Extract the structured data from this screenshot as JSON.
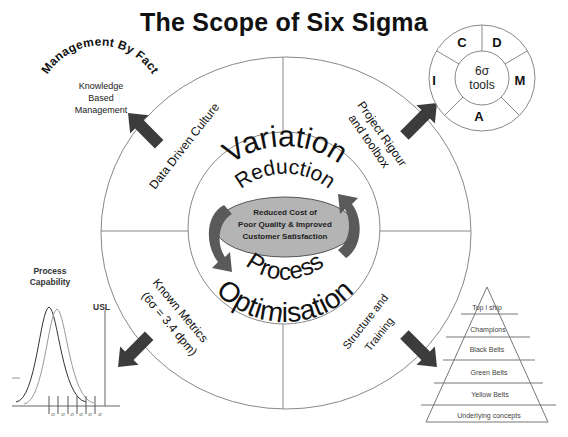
{
  "title": "The Scope of Six Sigma",
  "center": {
    "top_word_1": "Variation",
    "top_word_2": "Reduction",
    "bottom_word_1": "Process",
    "bottom_word_2": "Optimisation",
    "ellipse_lines": [
      "Reduced Cost of",
      "Poor Quality & Improved",
      "Customer Satisfaction"
    ]
  },
  "quadrants": {
    "top_left": "Data Driven Culture",
    "top_right": [
      "Project Rigour",
      "and toolbox"
    ],
    "bottom_left": [
      "Known Metrics",
      "(6σ = 3.4 dpm)"
    ],
    "bottom_right": [
      "Structure and",
      "Training"
    ]
  },
  "management_by_fact": {
    "heading": "Management By Fact",
    "lines": [
      "Knowledge",
      "Based",
      "Management"
    ]
  },
  "tools_wheel": {
    "center_lines": [
      "6σ",
      "tools"
    ],
    "segments": [
      "D",
      "M",
      "A",
      "I",
      "C"
    ]
  },
  "process_capability": {
    "heading_lines": [
      "Process",
      "Capability"
    ],
    "usl_label": "USL",
    "tick_label": "σ",
    "tick_count": 6
  },
  "pyramid": {
    "levels": [
      "Top l ship",
      "Champions",
      "Black Belts",
      "Green Belts",
      "Yellow Belts",
      "Underlying concepts"
    ]
  },
  "colors": {
    "arrow": "#3c3c3c",
    "cycle_arrow": "#5a5a5a",
    "ellipse_fill": "#b4b4b4",
    "ellipse_stroke": "#555555",
    "line": "#888888",
    "text": "#111111"
  }
}
